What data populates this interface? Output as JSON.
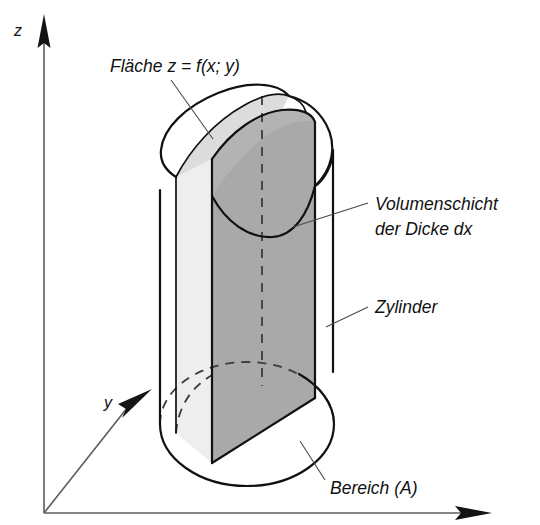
{
  "figure": {
    "background_color": "#ffffff",
    "width": 540,
    "height": 525
  },
  "axes": {
    "z": {
      "label": "z",
      "label_x": 14,
      "label_y": 36,
      "arrow_tip_x": 44,
      "arrow_tip_y": 14
    },
    "y": {
      "label": "y",
      "label_x": 104,
      "label_y": 408,
      "arrow_tip_x": 152,
      "arrow_tip_y": 389
    },
    "x": {
      "label": "",
      "arrow_tip_x": 492,
      "arrow_tip_y": 513
    },
    "origin_x": 44,
    "origin_y": 513,
    "line_color": "#5c5c5c",
    "arrow_color": "#141414"
  },
  "annotations": [
    {
      "name": "surface-label",
      "text": "Fläche z = f(x; y)",
      "text_x": 110,
      "text_y": 72,
      "leader": "M 171,80 L 213,139",
      "anchor": "start"
    },
    {
      "name": "volume-layer-label",
      "text_lines": [
        "Volumenschicht",
        "der Dicke dx"
      ],
      "text_x": 375,
      "text_y": 210,
      "line_height": 25,
      "leader": "M 368,203 L 293,227",
      "anchor": "start"
    },
    {
      "name": "cylinder-label",
      "text": "Zylinder",
      "text_x": 375,
      "text_y": 313,
      "leader": "M 368,307 L 326,327",
      "anchor": "start"
    },
    {
      "name": "region-label",
      "text": "Bereich (A)",
      "text_x": 330,
      "text_y": 494,
      "leader": "M 325,480 L 300,441",
      "anchor": "start"
    }
  ],
  "solid": {
    "name": "cylinder-with-curved-top",
    "colors": {
      "outline": "#111111",
      "top_surface_fill": "#ffffff",
      "slab_top_fill": "#dcdcdc",
      "slab_side_fill": "#eeeeee",
      "cut_plane_fill": "#a9a9a9",
      "cut_top_fill": "#b5b5b5",
      "hidden_edge": "#3c3c3c"
    },
    "geometry": {
      "left_wall_x": 160,
      "slab_left_x": 176,
      "slab_right_x": 212,
      "cut_right_x": 315,
      "right_wall_x": 333,
      "base_center_x": 247,
      "base_center_y": 424,
      "base_rx": 87,
      "base_ry": 62,
      "top_center_y": 152,
      "center_dash_top_y": 96,
      "center_dash_bottom_y": 386,
      "center_dash_x": 262
    }
  }
}
